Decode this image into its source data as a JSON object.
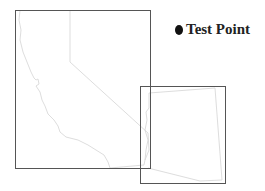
{
  "legend": {
    "items": [
      {
        "label": "Test Point",
        "symbol": "filled-circle",
        "color": "#111111"
      }
    ]
  },
  "map": {
    "frames": [
      {
        "name": "california-inset-frame",
        "x": 15,
        "y": 10,
        "width": 135,
        "height": 158,
        "stroke": "#555555"
      },
      {
        "name": "arizona-inset-frame",
        "x": 140,
        "y": 86,
        "width": 85,
        "height": 97,
        "stroke": "#555555"
      }
    ],
    "boundary_color": "#d4d4d4"
  }
}
